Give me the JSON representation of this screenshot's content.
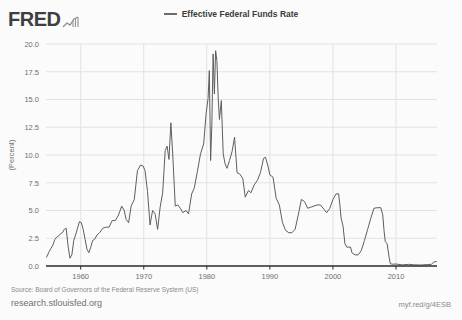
{
  "header": {
    "logo_text": "FRED",
    "logo_glyph_name": "fred-chart-glyph"
  },
  "legend": {
    "position": "top-center",
    "entries": [
      {
        "label": "Effective Federal Funds Rate",
        "color": "#6b6b6b"
      }
    ]
  },
  "footer": {
    "source": "Source: Board of Governors of the Federal Reserve System (US)",
    "site": "research.stlouisfed.org",
    "short_link": "myf.red/g/4ESB"
  },
  "chart_data": {
    "type": "line",
    "title": "",
    "subtitle": "",
    "xlabel": "",
    "ylabel": "(Percent)",
    "xlim": [
      1954.5,
      2016.5
    ],
    "ylim": [
      0.0,
      20.0
    ],
    "grid": true,
    "legend_position": "top-center",
    "yticks": [
      0.0,
      2.5,
      5.0,
      7.5,
      10.0,
      12.5,
      15.0,
      17.5,
      20.0
    ],
    "ytick_labels": [
      "0.0",
      "2.5",
      "5.0",
      "7.5",
      "10.0",
      "12.5",
      "15.0",
      "17.5",
      "20.0"
    ],
    "xticks": [
      1960,
      1970,
      1980,
      1990,
      2000,
      2010
    ],
    "xtick_labels": [
      "1960",
      "1970",
      "1980",
      "1990",
      "2000",
      "2010"
    ],
    "series": [
      {
        "name": "Effective Federal Funds Rate",
        "color": "#5e5e5e",
        "units": "Percent",
        "x": [
          1954.6,
          1955.0,
          1955.3,
          1955.6,
          1955.9,
          1956.2,
          1956.5,
          1956.8,
          1957.1,
          1957.4,
          1957.7,
          1958.0,
          1958.3,
          1958.6,
          1958.9,
          1959.2,
          1959.5,
          1959.8,
          1960.1,
          1960.4,
          1960.7,
          1961.0,
          1961.3,
          1961.6,
          1961.9,
          1962.2,
          1962.6,
          1963.0,
          1963.5,
          1964.0,
          1964.5,
          1965.0,
          1965.5,
          1966.0,
          1966.5,
          1966.9,
          1967.2,
          1967.6,
          1968.0,
          1968.5,
          1969.0,
          1969.5,
          1969.9,
          1970.2,
          1970.6,
          1971.0,
          1971.4,
          1971.8,
          1972.2,
          1972.6,
          1973.0,
          1973.4,
          1973.7,
          1974.0,
          1974.3,
          1974.6,
          1975.0,
          1975.4,
          1975.8,
          1976.2,
          1976.7,
          1977.1,
          1977.6,
          1978.0,
          1978.5,
          1979.0,
          1979.5,
          1979.9,
          1980.2,
          1980.4,
          1980.6,
          1980.8,
          1981.0,
          1981.2,
          1981.4,
          1981.6,
          1981.8,
          1982.0,
          1982.3,
          1982.6,
          1982.9,
          1983.2,
          1983.6,
          1984.0,
          1984.4,
          1984.8,
          1985.2,
          1985.7,
          1986.1,
          1986.6,
          1987.0,
          1987.5,
          1988.0,
          1988.5,
          1989.0,
          1989.3,
          1989.7,
          1990.0,
          1990.5,
          1991.0,
          1991.5,
          1992.0,
          1992.5,
          1993.0,
          1993.5,
          1994.0,
          1994.5,
          1995.0,
          1995.5,
          1996.0,
          1996.5,
          1997.0,
          1997.5,
          1998.0,
          1998.6,
          1999.0,
          1999.5,
          2000.0,
          2000.5,
          2000.9,
          2001.1,
          2001.3,
          2001.6,
          2001.9,
          2002.2,
          2002.8,
          2003.0,
          2003.5,
          2004.0,
          2004.5,
          2005.0,
          2005.5,
          2006.0,
          2006.5,
          2007.0,
          2007.6,
          2007.9,
          2008.1,
          2008.3,
          2008.6,
          2008.9,
          2009.1,
          2009.5,
          2010.0,
          2011.0,
          2012.0,
          2013.0,
          2014.0,
          2015.0,
          2015.6,
          2016.0,
          2016.4
        ],
        "y": [
          0.8,
          1.3,
          1.6,
          1.9,
          2.4,
          2.6,
          2.7,
          2.9,
          3.0,
          3.3,
          3.4,
          1.8,
          0.7,
          1.0,
          2.3,
          2.8,
          3.4,
          4.0,
          3.9,
          3.3,
          2.4,
          1.5,
          1.2,
          1.7,
          2.3,
          2.4,
          2.8,
          3.0,
          3.4,
          3.5,
          3.5,
          4.1,
          4.1,
          4.6,
          5.4,
          5.0,
          4.2,
          3.9,
          5.4,
          6.0,
          8.6,
          9.1,
          9.0,
          8.6,
          6.7,
          3.7,
          5.0,
          4.7,
          3.3,
          5.3,
          6.6,
          10.4,
          10.8,
          9.6,
          12.9,
          10.0,
          5.4,
          5.5,
          5.2,
          4.8,
          5.0,
          4.7,
          6.5,
          7.0,
          8.5,
          10.1,
          11.0,
          13.8,
          15.1,
          17.6,
          9.5,
          12.8,
          19.1,
          15.5,
          19.4,
          18.5,
          15.2,
          13.2,
          14.9,
          10.1,
          9.2,
          8.8,
          9.5,
          10.3,
          11.6,
          8.4,
          8.3,
          7.9,
          6.2,
          6.8,
          6.6,
          7.3,
          7.7,
          8.4,
          9.7,
          9.8,
          9.0,
          8.2,
          8.0,
          6.1,
          5.5,
          3.9,
          3.2,
          3.0,
          3.0,
          3.3,
          4.6,
          6.0,
          5.8,
          5.2,
          5.3,
          5.4,
          5.5,
          5.5,
          5.1,
          4.8,
          5.2,
          6.0,
          6.5,
          6.5,
          5.5,
          4.3,
          3.6,
          2.0,
          1.7,
          1.7,
          1.2,
          1.0,
          1.0,
          1.4,
          2.3,
          3.3,
          4.3,
          5.2,
          5.25,
          5.25,
          4.6,
          3.2,
          2.2,
          2.0,
          0.8,
          0.2,
          0.16,
          0.18,
          0.1,
          0.15,
          0.1,
          0.09,
          0.13,
          0.15,
          0.36,
          0.4
        ]
      }
    ]
  }
}
